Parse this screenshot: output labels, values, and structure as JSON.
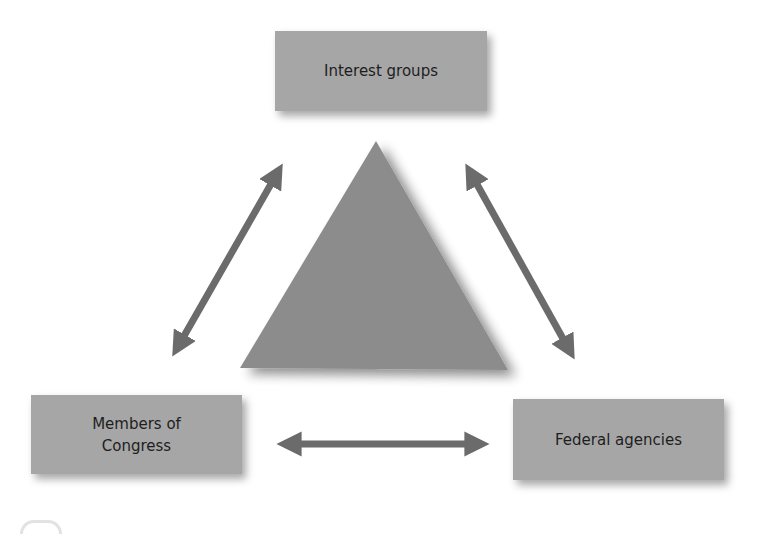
{
  "diagram": {
    "nodes": {
      "interest_groups": "Interest groups",
      "members_of_congress": "Members of Congress",
      "federal_agencies": "Federal agencies"
    },
    "edges": [
      {
        "from": "Members of Congress",
        "to": "Interest groups",
        "type": "bidirectional-arrow"
      },
      {
        "from": "Interest groups",
        "to": "Federal agencies",
        "type": "bidirectional-arrow"
      },
      {
        "from": "Members of Congress",
        "to": "Federal agencies",
        "type": "bidirectional-arrow"
      }
    ],
    "center_shape": "triangle",
    "colors": {
      "box_fill": "#a6a6a6",
      "triangle_fill": "#8c8c8c",
      "arrow": "#6b6b6b",
      "text": "#1e1e1e",
      "background": "#ffffff"
    }
  }
}
